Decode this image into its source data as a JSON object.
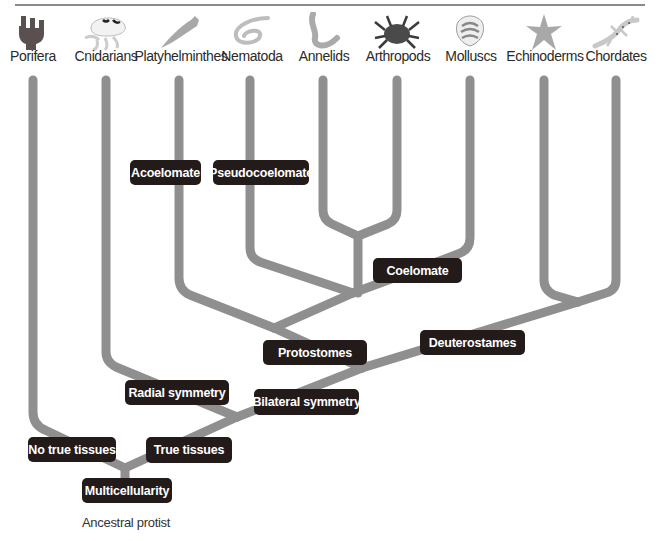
{
  "diagram": {
    "type": "phylogenetic-tree",
    "root_label": "Ancestral protist",
    "line_color": "#8f8f8f",
    "pill_color": "#231a1a",
    "taxa": [
      {
        "label": "Porifera",
        "icon": "sponge-icon",
        "x": 33
      },
      {
        "label": "Cnidarians",
        "icon": "jellyfish-icon",
        "x": 106
      },
      {
        "label": "Platyhelminthes",
        "icon": "flatworm-icon",
        "x": 179
      },
      {
        "label": "Nematoda",
        "icon": "roundworm-icon",
        "x": 250
      },
      {
        "label": "Annelids",
        "icon": "segmented-worm-icon",
        "x": 323
      },
      {
        "label": "Arthropods",
        "icon": "crab-icon",
        "x": 397
      },
      {
        "label": "Molluscs",
        "icon": "scallop-shell-icon",
        "x": 470
      },
      {
        "label": "Echinoderms",
        "icon": "starfish-icon",
        "x": 544
      },
      {
        "label": "Chordates",
        "icon": "gecko-icon",
        "x": 616
      }
    ],
    "traits": {
      "multicellularity": "Multicellularity",
      "no_true_tissues": "No true tissues",
      "true_tissues": "True tissues",
      "radial_symmetry": "Radial symmetry",
      "bilateral_symmetry": "Bilateral symmetry",
      "protostomes": "Protostomes",
      "deuterostames": "Deuterostames",
      "coelomate": "Coelomate",
      "acoelomate": "Acoelomate",
      "pseudocoelomate": "Pseudocoelomate"
    }
  }
}
